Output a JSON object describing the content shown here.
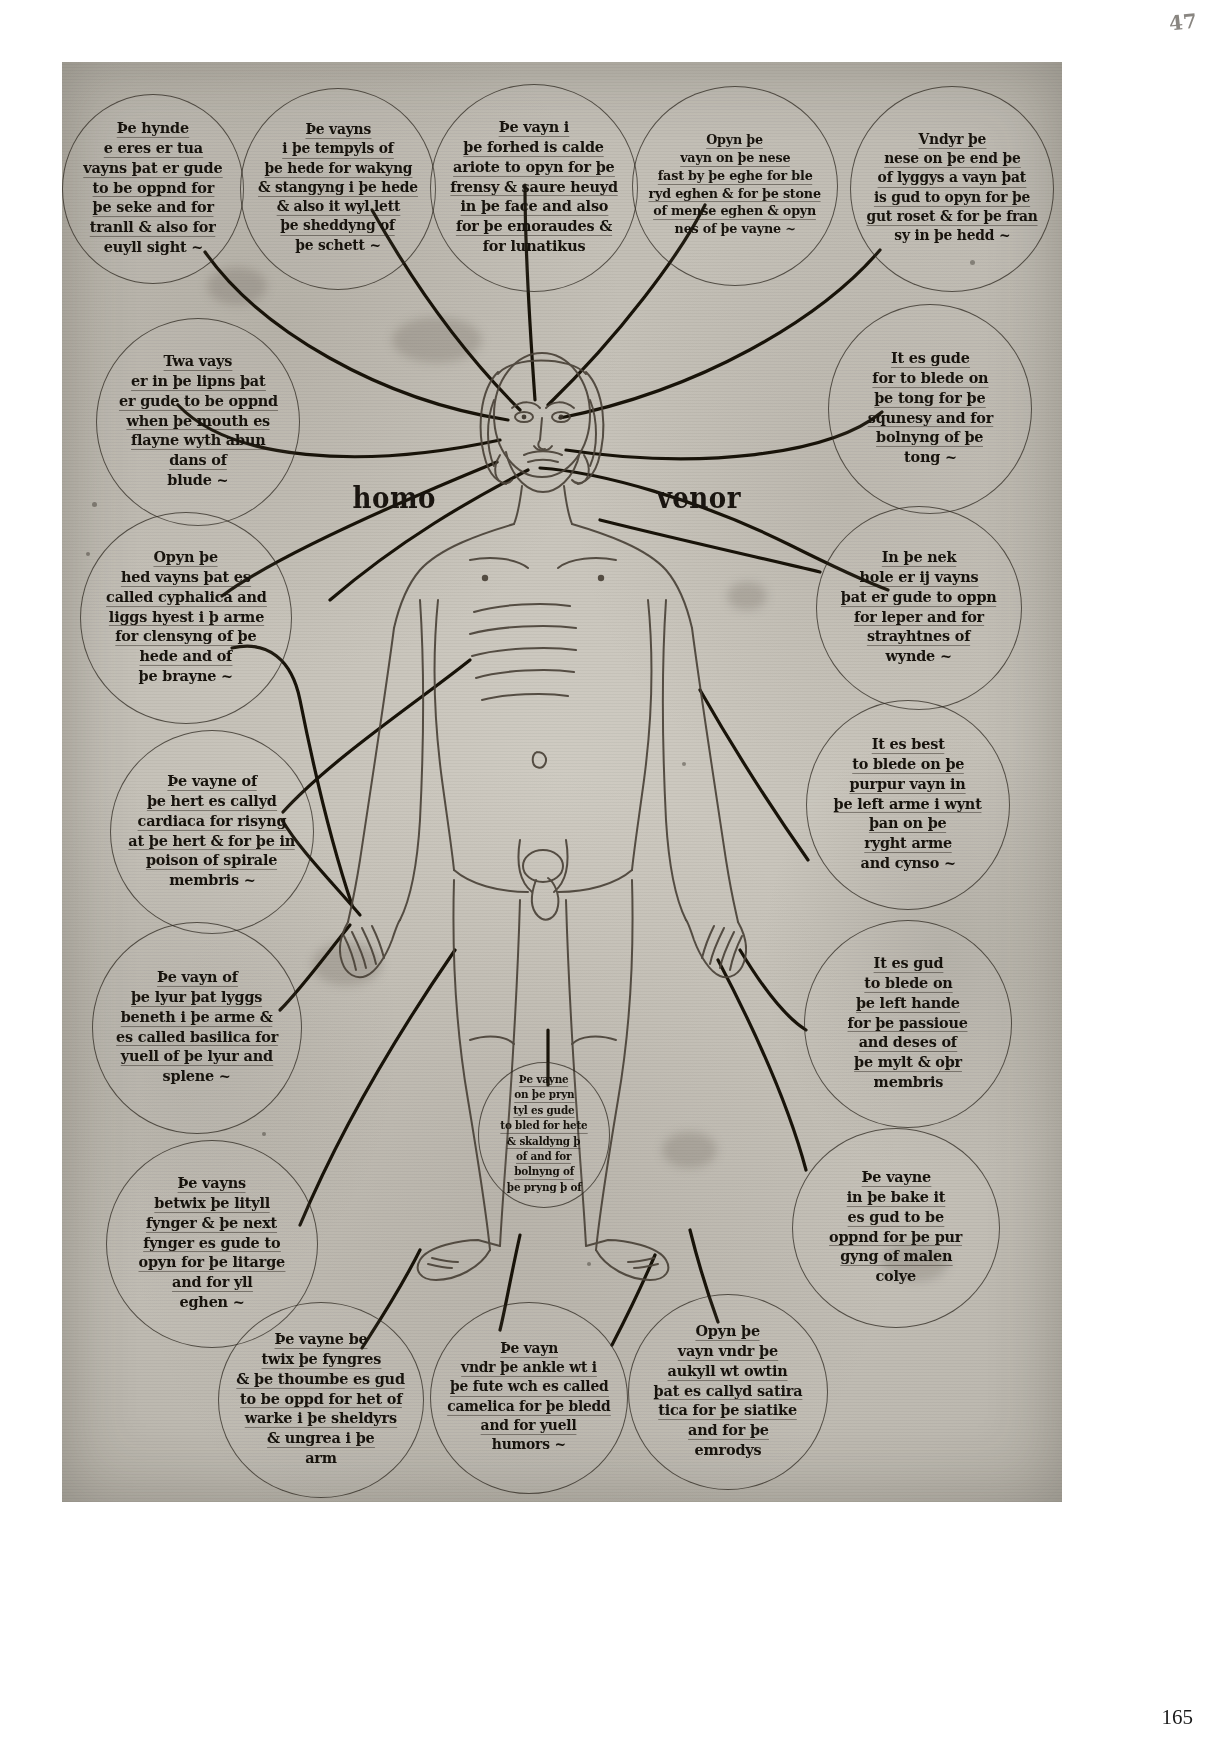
{
  "page": {
    "page_number": "165",
    "folio_mark": "47"
  },
  "figure": {
    "label_left": "homo",
    "label_right": "venor"
  },
  "circles": [
    {
      "id": "eyes-vein",
      "name": "circle-eyes-vein",
      "lines": [
        "Þe hynde",
        "e eres er tua",
        "vayns þat er gude",
        "to be oppnd for",
        "þe seke and for",
        "tranll & also for",
        "euyll sight ~"
      ]
    },
    {
      "id": "temple-vein",
      "name": "circle-temple-vein",
      "lines": [
        "Þe vayns",
        "i þe tempyls of",
        "þe hede for wakyng",
        "& stangyng i þe hede",
        "& also it wyl lett",
        "þe sheddyng of",
        "þe schett ~"
      ]
    },
    {
      "id": "forehead-vein",
      "name": "circle-forehead-vein",
      "lines": [
        "Þe vayn i",
        "þe forhed is calde",
        "ariote to opyn for þe",
        "frensy & saure heuyd",
        "in þe face and also",
        "for þe emoraudes &",
        "for lunatikus"
      ]
    },
    {
      "id": "nose-eye-vein",
      "name": "circle-nose-eye-vein",
      "lines": [
        "Opyn þe",
        "vayn on þe nese",
        "fast by þe eghe for ble",
        "ryd eghen & for þe stone",
        "of mense eghen & opyn",
        "nes of þe vayne ~"
      ]
    },
    {
      "id": "under-nose-vein",
      "name": "circle-under-nose-vein",
      "lines": [
        "Vndyr þe",
        "nese on þe end þe",
        "of lyggys a vayn þat",
        "is gud to opyn for þe",
        "gut roset & for þe fran",
        "sy in þe hedd ~"
      ]
    },
    {
      "id": "lips-veins",
      "name": "circle-lips-veins",
      "lines": [
        "Twa vays",
        "er in þe lipns þat",
        "er gude to be oppnd",
        "when þe mouth es",
        "flayne wyth abun",
        "dans of",
        "blude ~"
      ]
    },
    {
      "id": "tongue-vein",
      "name": "circle-tongue-vein",
      "lines": [
        "It es gude",
        "for to blede on",
        "þe tong for þe",
        "squnesy and for",
        "bolnyng of þe",
        "tong ~"
      ]
    },
    {
      "id": "head-cephalica",
      "name": "circle-head-cephalica",
      "lines": [
        "Opyn þe",
        "hed vayns þat es",
        "called cyphalica and",
        "liggs hyest i þ arme",
        "for clensyng of þe",
        "hede and   of",
        "þe brayne ~"
      ]
    },
    {
      "id": "neck-leper",
      "name": "circle-neck-leper",
      "lines": [
        "In þe nek",
        "hole er ij vayns",
        "þat er gude to oppn",
        "for leper and for",
        "strayhtnes of",
        "wynde ~"
      ]
    },
    {
      "id": "heart-cardiaca",
      "name": "circle-heart-cardiaca",
      "lines": [
        "Þe vayne of",
        "þe hert es callyd",
        "cardiaca for risyng",
        "at þe hert & for þe in",
        "poison of spirale",
        "membris ~"
      ]
    },
    {
      "id": "purple-vein-arm",
      "name": "circle-purple-vein-arm",
      "lines": [
        "It es best",
        "to blede on þe",
        "purpur vayn in",
        "þe left arme i wynt",
        "þan on þe",
        "ryght arme",
        "and cynso ~"
      ]
    },
    {
      "id": "liver-basilica",
      "name": "circle-liver-basilica",
      "lines": [
        "Þe vayn of",
        "þe lyur þat lyggs",
        "beneth i þe arme &",
        "es called basilica for",
        "yuell of þe lyur and",
        "splene ~"
      ]
    },
    {
      "id": "left-hand-vein",
      "name": "circle-left-hand-vein",
      "lines": [
        "It es gud",
        "to blede on",
        "þe left hande",
        "for þe passioue",
        "and deses of",
        "þe mylt & oþr",
        "membris"
      ]
    },
    {
      "id": "fingers-litargy",
      "name": "circle-fingers-litargy",
      "lines": [
        "Þe vayns",
        "betwix þe lityll",
        "fynger & þe next",
        "fynger es gude to",
        "opyn for þe litarge",
        "and for yll",
        "eghen ~"
      ]
    },
    {
      "id": "back-vein",
      "name": "circle-back-vein",
      "lines": [
        "Þe vayne",
        "in þe bake it",
        "es gud to be",
        "oppnd for þe pur",
        "gyng of malen",
        "colye"
      ]
    },
    {
      "id": "penis-vein",
      "name": "circle-penis-vein",
      "lines": [
        "Þe vayne",
        "on þe pryn",
        "tyl es gude",
        "to bled for hete",
        "& skaldyng þ",
        "of and for",
        "bolnyng of",
        "þe pryng þ of"
      ]
    },
    {
      "id": "thumb-vein",
      "name": "circle-thumb-vein",
      "lines": [
        "Þe vayne be",
        "twix þe fyngres",
        "& þe thoumbe es gud",
        "to be oppd for het of",
        "warke i þe sheldyrs",
        "& ungrea i þe",
        "arm"
      ]
    },
    {
      "id": "ankle-vein",
      "name": "circle-ankle-vein",
      "lines": [
        "Þe vayn",
        "vndr þe ankle wt i",
        "þe fute wch es called",
        "camelica for þe bledd",
        "and for yuell",
        "humors ~"
      ]
    },
    {
      "id": "sciatica-vein",
      "name": "circle-sciatica-vein",
      "lines": [
        "Opyn þe",
        "vayn vndr þe",
        "aukyll wt owtin",
        "þat es callyd satira",
        "tica for þe siatike",
        "and for þe",
        "emrodys"
      ]
    }
  ]
}
